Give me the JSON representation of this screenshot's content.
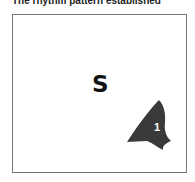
{
  "caption": "The rhythm pattern established",
  "main_letter": "S",
  "shape": {
    "label": "1",
    "fill": "#3a3a3a",
    "label_color": "#ffffff"
  }
}
